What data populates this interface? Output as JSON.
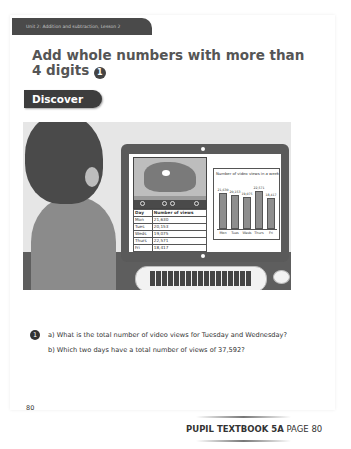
{
  "header": {
    "unit_banner": "Unit 2: Addition and subtraction, Lesson 2",
    "title": "Add whole numbers with more than 4 digits",
    "lesson_number": "1",
    "section_label": "Discover"
  },
  "illustration": {
    "table": {
      "headers": [
        "Day",
        "Number of views"
      ],
      "rows": [
        [
          "Mon",
          "21,630"
        ],
        [
          "Tues",
          "20,153"
        ],
        [
          "Weds",
          "19,075"
        ],
        [
          "Thurs",
          "22,571"
        ],
        [
          "Fri",
          "18,417"
        ]
      ]
    },
    "chart": {
      "title": "Number of video views in a week"
    }
  },
  "chart_data": {
    "type": "bar",
    "title": "Number of video views in a week",
    "categories": [
      "Mon",
      "Tues",
      "Weds",
      "Thurs",
      "Fri"
    ],
    "values": [
      21630,
      20153,
      19075,
      22571,
      18417
    ],
    "value_labels": [
      "21,630",
      "20,153",
      "19,075",
      "22,571",
      "18,417"
    ],
    "xlabel": "",
    "ylabel": "",
    "grid": false,
    "legend": null
  },
  "questions": {
    "number": "1",
    "a": "a)  What is the total number of video views for Tuesday and Wednesday?",
    "b": "b)  Which two days have a total number of views of 37,592?"
  },
  "footer": {
    "page_number": "80",
    "book_label": "PUPIL TEXTBOOK 5A",
    "page_label": "PAGE 80"
  }
}
